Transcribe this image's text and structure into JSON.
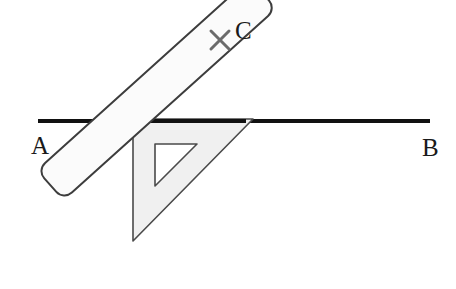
{
  "figure": {
    "background_color": "#ffffff",
    "canvas": {
      "width": 456,
      "height": 289
    }
  },
  "labels": {
    "a": "A",
    "b": "B",
    "c": "C"
  },
  "line_ab": {
    "name": "line-ab",
    "x1": 38,
    "y1": 121,
    "x2": 430,
    "y2": 121,
    "stroke": "#111111",
    "stroke_width": 4
  },
  "point_c": {
    "name": "point-c-cross-mark",
    "cx": 220,
    "cy": 40,
    "arm": 9,
    "stroke": "#6b6b6b",
    "stroke_width": 3
  },
  "set_square": {
    "name": "set-square",
    "outer_points": "133,119 253,119 133,241",
    "inner_points": "155,144 197,144 155,186",
    "fill": "#f0f0f0",
    "inner_fill": "#ffffff",
    "stroke": "#4a4a4a",
    "stroke_width": 1.6
  },
  "ruler": {
    "name": "ruler",
    "x": -14,
    "y": -128,
    "width": 286,
    "height": 40,
    "radius": 11,
    "rotation_deg": -42,
    "pivot_x": 133,
    "pivot_y": 256,
    "fill": "#fbfbfb",
    "stroke": "#3d3d3d",
    "stroke_width": 2
  },
  "colors": {
    "ink": "#111111",
    "pencil_gray": "#6b6b6b",
    "plastic_gray": "#f0f0f0",
    "outline": "#4a4a4a"
  }
}
